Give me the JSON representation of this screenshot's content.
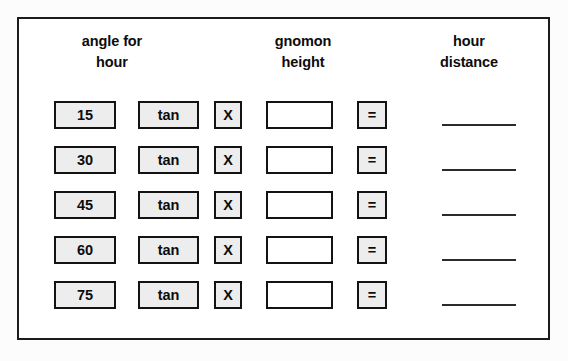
{
  "page": {
    "frame_color": "#1b1b1b",
    "cell_fill_color": "#ededed",
    "text_color": "#0c0c0c"
  },
  "headers": {
    "angle": {
      "line1": "angle for",
      "line2": "hour"
    },
    "gnomon": {
      "line1": "gnomon",
      "line2": "height"
    },
    "distance": {
      "line1": "hour",
      "line2": "distance"
    }
  },
  "operators": {
    "function_label": "tan",
    "multiply_label": "X",
    "equals_label": "="
  },
  "rows": [
    {
      "angle": "15",
      "function": "tan",
      "multiply": "X",
      "gnomon_height": "",
      "equals": "=",
      "hour_distance": ""
    },
    {
      "angle": "30",
      "function": "tan",
      "multiply": "X",
      "gnomon_height": "",
      "equals": "=",
      "hour_distance": ""
    },
    {
      "angle": "45",
      "function": "tan",
      "multiply": "X",
      "gnomon_height": "",
      "equals": "=",
      "hour_distance": ""
    },
    {
      "angle": "60",
      "function": "tan",
      "multiply": "X",
      "gnomon_height": "",
      "equals": "=",
      "hour_distance": ""
    },
    {
      "angle": "75",
      "function": "tan",
      "multiply": "X",
      "gnomon_height": "",
      "equals": "=",
      "hour_distance": ""
    }
  ]
}
